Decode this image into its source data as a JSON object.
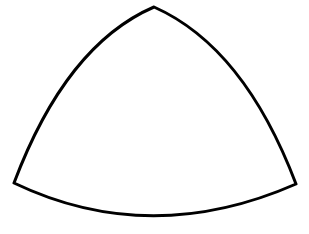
{
  "figure": {
    "shape": "reuleaux-triangle",
    "stroke_color": "#000000",
    "fill_color": "#ffffff",
    "background_color": "#ffffff",
    "stroke_width": 3,
    "vertices": {
      "top": [
        154,
        7
      ],
      "left": [
        14,
        183
      ],
      "right": [
        296,
        184
      ]
    }
  }
}
